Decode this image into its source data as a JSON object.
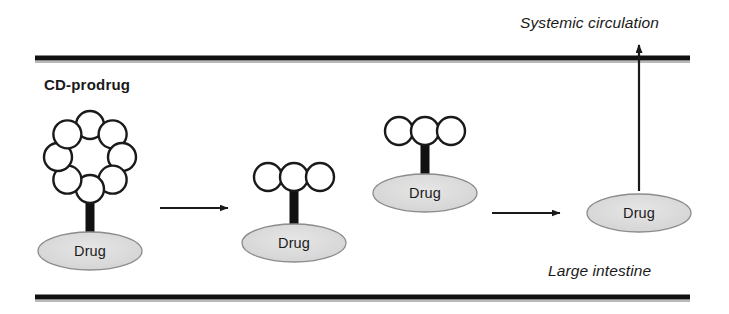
{
  "figure": {
    "title_label": "CD-prodrug",
    "top_region_label": "Systemic circulation",
    "bottom_region_label": "Large intestine",
    "colors": {
      "membrane": "#111111",
      "membrane_shadow": "#b9b9b9",
      "circle_stroke": "#1a1a1a",
      "linker": "#111111",
      "drug_fill": "#d9d9d9",
      "drug_stroke": "#8c8c8c",
      "arrow": "#1a1a1a",
      "text": "#1a1a1a",
      "background": "#ffffff"
    }
  },
  "membranes": [
    {
      "name": "top-membrane",
      "x1": 35,
      "x2": 690,
      "y": 58
    },
    {
      "name": "bottom-membrane",
      "x1": 35,
      "x2": 690,
      "y": 297
    }
  ],
  "structures": [
    {
      "id": "cd-prodrug",
      "label": "CD-prodrug",
      "ring_type": "cyclic",
      "circle_count": 8,
      "circle_radius": 14,
      "ring_center_x": 90,
      "ring_center_y": 157,
      "ring_radius": 32,
      "linker": {
        "x": 90,
        "y_top": 176,
        "y_bottom": 248,
        "width": 9
      },
      "drug": {
        "label": "Drug",
        "cx": 90,
        "cy": 251,
        "rx": 52,
        "ry": 19
      }
    },
    {
      "id": "partially-degraded-prodrug",
      "label": "",
      "ring_type": "linear",
      "circle_count": 3,
      "circle_radius": 14,
      "row_center_x": 294,
      "row_center_y": 177,
      "linker": {
        "x": 294,
        "y_top": 186,
        "y_bottom": 240,
        "width": 9
      },
      "drug": {
        "label": "Drug",
        "cx": 294,
        "cy": 243,
        "rx": 52,
        "ry": 19
      }
    },
    {
      "id": "partially-degraded-prodrug-absorbing",
      "label": "",
      "ring_type": "linear",
      "circle_count": 3,
      "circle_radius": 14,
      "row_center_x": 425,
      "row_center_y": 131,
      "linker": {
        "x": 425,
        "y_top": 140,
        "y_bottom": 190,
        "width": 9
      },
      "drug": {
        "label": "Drug",
        "cx": 425,
        "cy": 193,
        "rx": 52,
        "ry": 19
      }
    },
    {
      "id": "free-drug",
      "label": "",
      "ring_type": "none",
      "circle_count": 0,
      "drug": {
        "label": "Drug",
        "cx": 639,
        "cy": 213,
        "rx": 52,
        "ry": 19
      }
    }
  ],
  "arrows": [
    {
      "name": "arrow-step-1",
      "direction": "right",
      "x1": 160,
      "y1": 208,
      "x2": 228,
      "y2": 208
    },
    {
      "name": "arrow-step-2",
      "direction": "right",
      "x1": 492,
      "y1": 213,
      "x2": 560,
      "y2": 213
    },
    {
      "name": "arrow-absorption",
      "direction": "up",
      "x1": 639,
      "y1": 191,
      "x2": 639,
      "y2": 45
    }
  ],
  "labels": [
    {
      "name": "label-systemic-circulation",
      "text": "Systemic circulation",
      "x": 520,
      "y": 14,
      "style": "italic"
    },
    {
      "name": "label-cd-prodrug",
      "text": "CD-prodrug",
      "x": 44,
      "y": 76,
      "style": "bold"
    },
    {
      "name": "label-large-intestine",
      "text": "Large intestine",
      "x": 548,
      "y": 262,
      "style": "italic"
    }
  ]
}
